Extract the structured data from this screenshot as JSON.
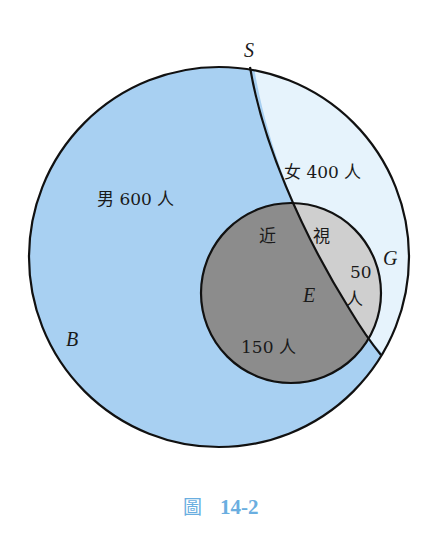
{
  "diagram": {
    "type": "venn",
    "sets": {
      "outer": "S",
      "boys": "B",
      "girls": "G",
      "myopia": "E"
    },
    "labels": {
      "boys": "男 600 人",
      "girls": "女 400 人",
      "myopia_left": "近",
      "myopia_right": "視",
      "girls_myopia_count": "50",
      "girls_myopia_unit": "人",
      "boys_myopia": "150 人"
    },
    "values": {
      "boys_total": 600,
      "girls_total": 400,
      "boys_myopia": 150,
      "girls_myopia": 50
    },
    "colors": {
      "boys_fill": "#a8d0f2",
      "girls_fill": "#e6f3fc",
      "boys_myopia_fill": "#8c8c8c",
      "girls_myopia_fill": "#cfcfcf",
      "stroke": "#111111",
      "caption": "#6aaee0"
    }
  },
  "caption": {
    "prefix": "圖",
    "number": "14-2"
  }
}
